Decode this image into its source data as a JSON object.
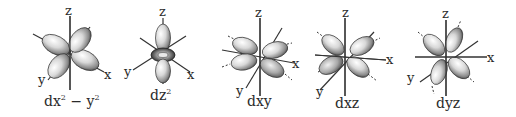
{
  "diagram": {
    "axis_labels": {
      "z": "z",
      "x": "x",
      "y": "y"
    },
    "orbitals": [
      {
        "id": "dx2y2",
        "label_base": "dx",
        "label_sup1": "2",
        "label_mid": " − y",
        "label_sup2": "2",
        "center": [
          70,
          52
        ]
      },
      {
        "id": "dz2",
        "label_base": "dz",
        "label_sup1": "2",
        "center": [
          163,
          54
        ]
      },
      {
        "id": "dxy",
        "label_base": "dxy",
        "center": [
          260,
          56
        ]
      },
      {
        "id": "dxz",
        "label_base": "dxz",
        "center": [
          352,
          56
        ]
      },
      {
        "id": "dyz",
        "label_base": "dyz",
        "center": [
          446,
          58
        ]
      }
    ],
    "colors": {
      "axis": "#333333",
      "lobe_light": "#f4f4f4",
      "lobe_dark": "#4a4a4a",
      "text": "#2a2a2a"
    }
  }
}
